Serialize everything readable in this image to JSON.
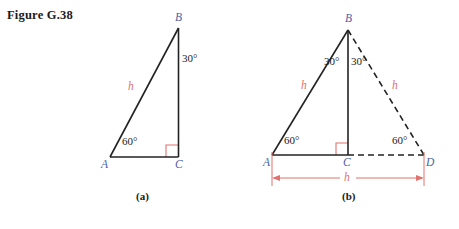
{
  "figure": {
    "title": "Figure G.38"
  },
  "colors": {
    "vertex_label": "#4a5fa8",
    "measure_red": "#e2706d",
    "stroke_dark": "#222222",
    "text_black": "#1b1b1b",
    "background": "#ffffff"
  },
  "panel_a": {
    "caption": "(a)",
    "vertices": {
      "A": "A",
      "B": "B",
      "C": "C"
    },
    "angles": {
      "at_B": "30°",
      "at_A": "60°",
      "at_C": "right-angle-marker"
    },
    "side_labels": {
      "hypotenuse": "h"
    }
  },
  "panel_b": {
    "caption": "(b)",
    "vertices": {
      "A": "A",
      "B": "B",
      "C": "C",
      "D": "D"
    },
    "angles": {
      "at_B_left": "30°",
      "at_B_right": "30°",
      "at_A": "60°",
      "at_D": "60°",
      "at_C": "right-angle-marker"
    },
    "side_labels": {
      "left_side": "h",
      "right_side": "h",
      "base_dimension": "h"
    }
  }
}
